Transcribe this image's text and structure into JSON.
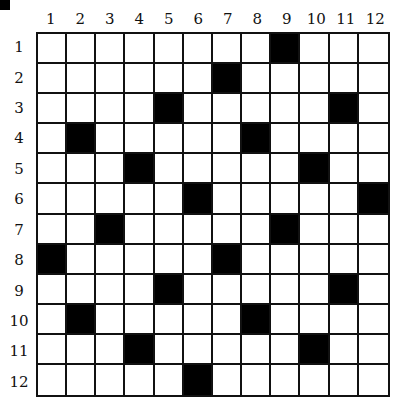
{
  "puzzle": {
    "type": "crossword-grid",
    "rows": 12,
    "cols": 12,
    "column_labels": [
      "1",
      "2",
      "3",
      "4",
      "5",
      "6",
      "7",
      "8",
      "9",
      "10",
      "11",
      "12"
    ],
    "row_labels": [
      "1",
      "2",
      "3",
      "4",
      "5",
      "6",
      "7",
      "8",
      "9",
      "10",
      "11",
      "12"
    ],
    "black_cells": [
      [
        1,
        9
      ],
      [
        2,
        7
      ],
      [
        3,
        5
      ],
      [
        3,
        11
      ],
      [
        4,
        2
      ],
      [
        4,
        8
      ],
      [
        5,
        4
      ],
      [
        5,
        10
      ],
      [
        6,
        6
      ],
      [
        6,
        12
      ],
      [
        7,
        3
      ],
      [
        7,
        9
      ],
      [
        8,
        1
      ],
      [
        8,
        7
      ],
      [
        9,
        5
      ],
      [
        9,
        11
      ],
      [
        10,
        2
      ],
      [
        10,
        8
      ],
      [
        11,
        4
      ],
      [
        11,
        10
      ],
      [
        12,
        6
      ]
    ],
    "colors": {
      "black": "#000000",
      "white": "#ffffff",
      "line": "#111111"
    }
  }
}
